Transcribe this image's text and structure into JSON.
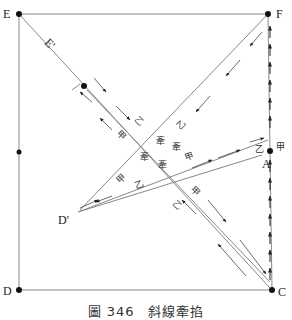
{
  "figure": {
    "caption": "圖 346　斜線牽掐",
    "points": {
      "E": "E",
      "E_prime": "E'",
      "F": "F",
      "D": "D",
      "D_prime": "D'",
      "C": "C",
      "A": "A"
    },
    "thread_labels": {
      "jia": "甲",
      "yi": "乙",
      "qian": "牽"
    },
    "colors": {
      "line": "#777777",
      "arrow": "#222222",
      "dot": "#111111",
      "background": "#ffffff"
    }
  }
}
